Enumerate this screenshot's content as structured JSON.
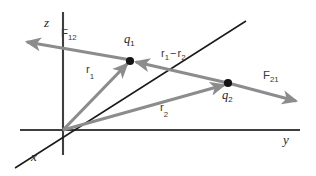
{
  "figure": {
    "type": "physics-vector-diagram",
    "background_color": "#ffffff"
  },
  "colors": {
    "axis": "#3f3f3f",
    "x_axis": "#1a1a1a",
    "vector": "#8c8c8c",
    "point": "#141414",
    "label": "#2b2b2b"
  },
  "axes": [
    {
      "id": "z",
      "label": "z",
      "orientation": "vertical",
      "label_x": 44,
      "label_y": 16
    },
    {
      "id": "y",
      "label": "y",
      "orientation": "horizontal",
      "label_x": 283,
      "label_y": 137
    },
    {
      "id": "x",
      "label": "x",
      "orientation": "diagonal",
      "label_x": 31,
      "label_y": 154
    }
  ],
  "origin": {
    "x": 63,
    "y": 130
  },
  "points": [
    {
      "id": "q1",
      "label": "q",
      "sub": "1",
      "x": 130,
      "y": 61,
      "label_x": 124,
      "label_y": 36
    },
    {
      "id": "q2",
      "label": "q",
      "sub": "2",
      "x": 228,
      "y": 83,
      "label_x": 222,
      "label_y": 91
    }
  ],
  "vectors": [
    {
      "id": "r1",
      "label": "r",
      "sub": "1",
      "from": "origin",
      "to": "q1",
      "label_x": 86,
      "label_y": 68,
      "color": "#8c8c8c"
    },
    {
      "id": "r2",
      "label": "r",
      "sub": "2",
      "from": "origin",
      "to": "q2",
      "label_x": 160,
      "label_y": 106,
      "color": "#8c8c8c"
    },
    {
      "id": "F12",
      "label": "F",
      "sub": "12",
      "from": "q1",
      "to": "upper-left",
      "label_x": 61,
      "label_y": 31,
      "color": "#8c8c8c"
    },
    {
      "id": "F21",
      "label": "F",
      "sub": "21",
      "from": "q2",
      "to": "lower-right",
      "label_x": 263,
      "label_y": 73,
      "color": "#8c8c8c"
    },
    {
      "id": "r1_minus_r2",
      "label_parts": {
        "first": "r",
        "first_sub": "1",
        "operator": "−",
        "second": "r",
        "second_sub": "2"
      },
      "from": "q2",
      "to": "q1",
      "label_x": 161,
      "label_y": 51,
      "color": "#8c8c8c"
    }
  ]
}
